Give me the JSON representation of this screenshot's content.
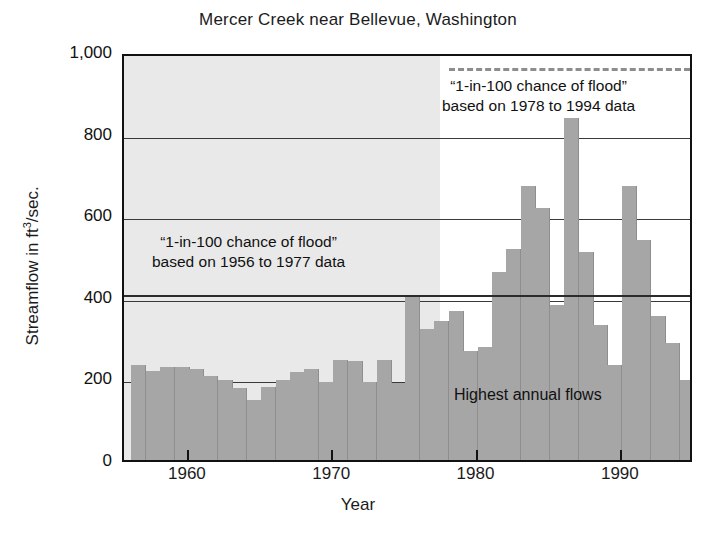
{
  "figure": {
    "title": "Mercer Creek near Bellevue, Washington",
    "credit": "Greene, USGS.",
    "xlabel": "Year",
    "ylabel_pre": "Streamflow in ft",
    "ylabel_sup": "3",
    "ylabel_post": "/sec.",
    "annotation_old_line1": "“1-in-100 chance of flood”",
    "annotation_old_line2": "based on 1956 to 1977 data",
    "annotation_new_line1": "“1-in-100 chance of flood”",
    "annotation_new_line2": "based on 1978 to 1994 data",
    "series_label": "Highest annual flows",
    "colors": {
      "bar": "#a6a6a6",
      "shaded_region": "#e9e9e9",
      "axis": "#111111",
      "flood_old_line": "#2b2b2b",
      "flood_new_line": "#8d8d8d",
      "background": "#ffffff"
    }
  },
  "chart_data": {
    "type": "bar",
    "title": "Mercer Creek near Bellevue, Washington",
    "xlabel": "Year",
    "ylabel": "Streamflow in ft3/sec.",
    "xlim": [
      1955.5,
      1995.0
    ],
    "ylim": [
      0,
      1000
    ],
    "yticks": [
      0,
      200,
      400,
      600,
      800,
      1000
    ],
    "ytick_labels": [
      "0",
      "200",
      "400",
      "600",
      "800",
      "1,000"
    ],
    "xticks": [
      1960,
      1970,
      1980,
      1990
    ],
    "xtick_labels": [
      "1960",
      "1970",
      "1980",
      "1990"
    ],
    "grid": "horizontal",
    "legend": "none",
    "series_name": "Highest annual flows",
    "categories": [
      1956,
      1957,
      1958,
      1959,
      1960,
      1961,
      1962,
      1963,
      1964,
      1965,
      1966,
      1967,
      1968,
      1969,
      1970,
      1971,
      1972,
      1973,
      1974,
      1975,
      1976,
      1977,
      1978,
      1979,
      1980,
      1981,
      1982,
      1983,
      1984,
      1985,
      1986,
      1987,
      1988,
      1989,
      1990,
      1991,
      1992,
      1993,
      1994
    ],
    "values": [
      232,
      218,
      228,
      228,
      222,
      205,
      196,
      176,
      148,
      180,
      196,
      216,
      222,
      190,
      246,
      242,
      190,
      246,
      189,
      400,
      320,
      340,
      365,
      268,
      276,
      462,
      518,
      672,
      618,
      380,
      838,
      510,
      332,
      232,
      672,
      540,
      352,
      288,
      196
    ],
    "annotations": [
      {
        "text": "“1-in-100 chance of flood” based on 1956 to 1977 data",
        "value": 415,
        "style": "solid",
        "span_years": [
          1956,
          1994
        ]
      },
      {
        "text": "“1-in-100 chance of flood” based on 1978 to 1994 data",
        "value": 970,
        "style": "dashed",
        "span_years": [
          1978,
          1994
        ]
      }
    ],
    "shaded_region": {
      "from": 1956,
      "to": 1977.5,
      "note": "1956 to 1977 period shading"
    }
  }
}
